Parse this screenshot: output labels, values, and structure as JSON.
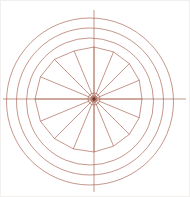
{
  "canvas": {
    "width": 190,
    "height": 197,
    "background_color": "#ffffff"
  },
  "drawing": {
    "type": "geometric-construction-wheel",
    "line_color": "#a45c4a",
    "line_width": 0.75,
    "line_opacity": 0.85,
    "hub_dot_color": "#6e352a",
    "hub": {
      "x": 94,
      "y": 99
    },
    "rings": {
      "cx": 90,
      "cy": 101.5,
      "radii": [
        83.5,
        73.5,
        63.5
      ]
    },
    "axes": {
      "horizontal": {
        "x1": 3,
        "y1": 99,
        "x2": 186,
        "y2": 99
      },
      "vertical": {
        "x1": 94,
        "y1": 10,
        "x2": 94,
        "y2": 192
      }
    },
    "spokes": {
      "count": 16,
      "angle_step_deg": 22.5,
      "start_angle_deg": 0,
      "vertex_radii": [
        48,
        49,
        50,
        51,
        52,
        52,
        56,
        58,
        59,
        58,
        56,
        54,
        53,
        51,
        50,
        49
      ]
    },
    "hub_bullseye": {
      "ring_radii": [
        3,
        6
      ],
      "dot_radius": 1.7
    }
  }
}
